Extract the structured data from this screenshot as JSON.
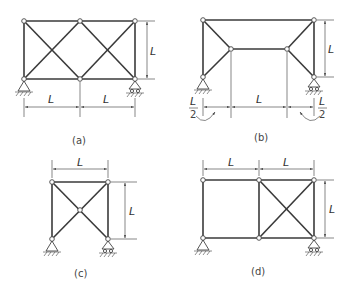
{
  "figures": [
    {
      "id": "a",
      "caption": "(a)",
      "dim_labels": [
        "L",
        "L",
        "L"
      ],
      "description": "Two-panel truss with X-bracing in both panels; pin support left, roller support right"
    },
    {
      "id": "b",
      "caption": "(b)",
      "dim_labels": [
        "L",
        "L",
        "L/2",
        "L/2"
      ],
      "half_num": "L",
      "half_den": "2",
      "description": "Truss with top chord and inset lower chord; triangular end panels; pin left, roller right"
    },
    {
      "id": "c",
      "caption": "(c)",
      "dim_labels": [
        "L",
        "L"
      ],
      "description": "Single square panel with X-bracing meeting at center node; pin left, roller right"
    },
    {
      "id": "d",
      "caption": "(d)",
      "dim_labels": [
        "L",
        "L",
        "L"
      ],
      "description": "Two-panel truss, left panel unbraced, right panel X-braced; pin left, roller right"
    }
  ],
  "label": "L"
}
